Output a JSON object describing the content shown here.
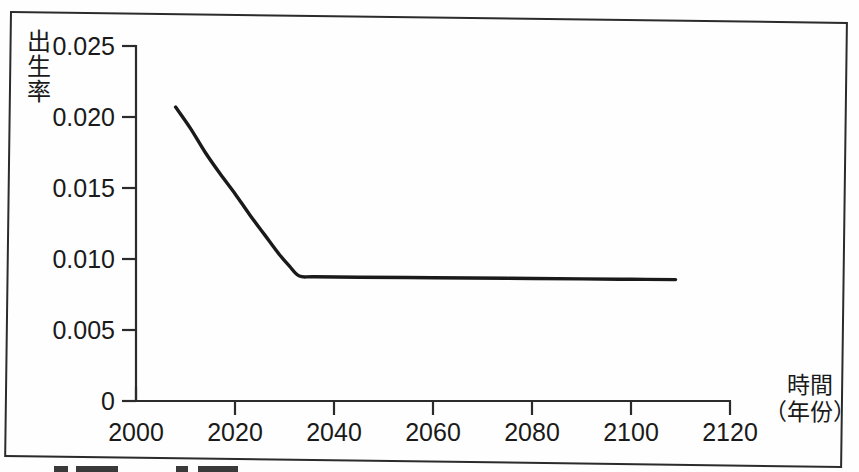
{
  "chart_data": {
    "type": "line",
    "title": "",
    "xlabel": "時間（年份）",
    "ylabel": "出生率",
    "xlabel_lines": [
      "時間",
      "（年份）"
    ],
    "ylabel_chars": [
      "出",
      "生",
      "率"
    ],
    "xlim": [
      2000,
      2120
    ],
    "ylim": [
      0,
      0.025
    ],
    "xticks": [
      2000,
      2020,
      2040,
      2060,
      2080,
      2100,
      2120
    ],
    "xtick_labels": [
      "2000",
      "2020",
      "2040",
      "2060",
      "2080",
      "2100",
      "2120"
    ],
    "yticks": [
      0,
      0.005,
      0.01,
      0.015,
      0.02,
      0.025
    ],
    "ytick_labels": [
      "0",
      "0.005",
      "0.010",
      "0.015",
      "0.020",
      "0.025"
    ],
    "grid": false,
    "legend": null,
    "line_color": "#1a1a1a",
    "series": [
      {
        "name": "出生率",
        "x": [
          2008,
          2011,
          2014,
          2017,
          2020,
          2023,
          2026,
          2029,
          2031,
          2033,
          2036,
          2045,
          2060,
          2075,
          2090,
          2100,
          2109
        ],
        "y": [
          0.0207,
          0.0192,
          0.0175,
          0.016,
          0.0146,
          0.0131,
          0.0117,
          0.0103,
          0.0095,
          0.0088,
          0.00875,
          0.00872,
          0.00868,
          0.00864,
          0.0086,
          0.00857,
          0.00855
        ]
      }
    ]
  },
  "axis": {
    "y_title": "出生率",
    "x_title_line1": "時間",
    "x_title_line2": "（年份）"
  },
  "colors": {
    "line": "#1a1a1a",
    "axis": "#2b2b2b",
    "frame": "#2b2b2b",
    "background": "#fefefe"
  }
}
